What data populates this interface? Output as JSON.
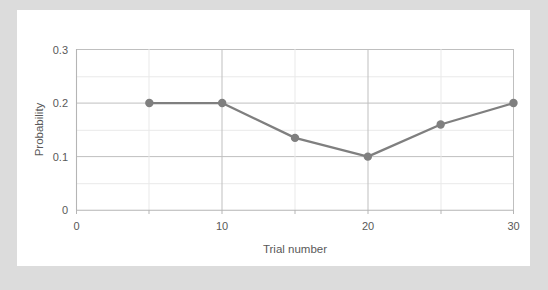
{
  "chart_data": {
    "type": "line",
    "title": "",
    "xlabel": "Trial number",
    "ylabel": "Probability",
    "x": [
      5,
      10,
      15,
      20,
      25,
      30
    ],
    "values": [
      0.2,
      0.2,
      0.135,
      0.1,
      0.16,
      0.2
    ],
    "series": [
      {
        "name": "Probability",
        "x": [
          5,
          10,
          15,
          20,
          25,
          30
        ],
        "values": [
          0.2,
          0.2,
          0.135,
          0.1,
          0.16,
          0.2
        ],
        "color": "#7f7f7f",
        "marker": "circle"
      }
    ],
    "xlim": [
      0,
      30
    ],
    "ylim": [
      0,
      0.3
    ],
    "x_tick_labels": [
      "0",
      "10",
      "20",
      "30"
    ],
    "x_tick_values": [
      0,
      10,
      20,
      30
    ],
    "x_minor_tick_values": [
      5,
      15,
      25
    ],
    "y_tick_labels": [
      "0",
      "0.1",
      "0.2",
      "0.3"
    ],
    "y_tick_values": [
      0,
      0.1,
      0.2,
      0.3
    ],
    "y_minor_tick_values": [
      0.05,
      0.15,
      0.25
    ],
    "grid": true,
    "legend": false,
    "legend_position": "none",
    "colors": {
      "series": "#7f7f7f",
      "grid_major": "#bfbfbf",
      "grid_minor": "#e9e9e9",
      "axis": "#b5b5b5",
      "text": "#595959",
      "plot_background": "#ffffff",
      "page_background": "#dcdcdc"
    }
  },
  "axes": {
    "y_label": "Probability",
    "x_label": "Trial number",
    "y_ticks": [
      {
        "label": "0.3"
      },
      {
        "label": "0.2"
      },
      {
        "label": "0.1"
      },
      {
        "label": "0"
      }
    ],
    "x_ticks": [
      {
        "label": "0"
      },
      {
        "label": "10"
      },
      {
        "label": "20"
      },
      {
        "label": "30"
      }
    ]
  }
}
